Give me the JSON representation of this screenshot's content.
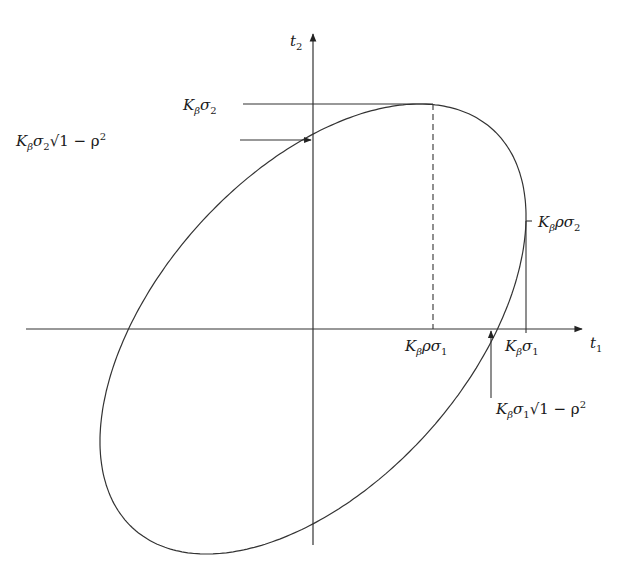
{
  "diagram": {
    "type": "confidence-ellipse",
    "axes": {
      "x_label": {
        "base": "t",
        "sub": "1"
      },
      "y_label": {
        "base": "t",
        "sub": "2"
      }
    },
    "ellipse": {
      "K_sigma1": 213,
      "K_sigma2": 225,
      "rho": 0.5
    },
    "annotations": {
      "top": {
        "K": "K",
        "beta": "β",
        "sigma": "σ",
        "sub": "2"
      },
      "y_intercept": {
        "K": "K",
        "beta": "β",
        "sigma": "σ",
        "sub": "2",
        "root": "√",
        "radicand": "1 − ρ",
        "exp": "2"
      },
      "right": {
        "K": "K",
        "beta": "β",
        "rho": "ρ",
        "sigma": "σ",
        "sub": "2"
      },
      "x_rho": {
        "K": "K",
        "beta": "β",
        "rho": "ρ",
        "sigma": "σ",
        "sub": "1"
      },
      "x_max": {
        "K": "K",
        "beta": "β",
        "sigma": "σ",
        "sub": "1"
      },
      "x_intercept": {
        "K": "K",
        "beta": "β",
        "sigma": "σ",
        "sub": "1",
        "root": "√",
        "radicand": "1 − ρ",
        "exp": "2"
      }
    }
  }
}
